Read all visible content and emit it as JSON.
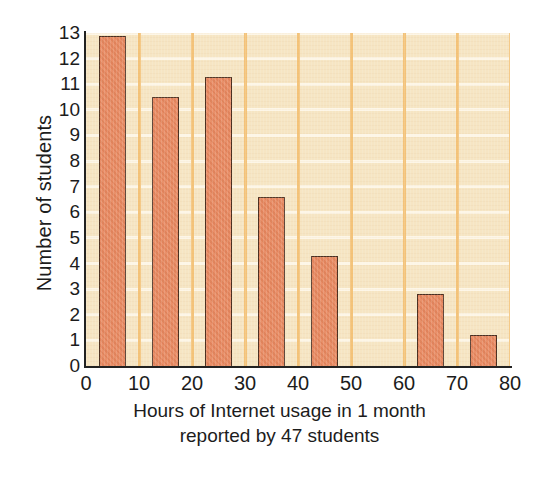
{
  "chart_data": {
    "type": "bar",
    "title": "",
    "subtitle": "",
    "xlabel": "Hours of Internet usage in 1 month",
    "xlabel_line2": "reported by 47 students",
    "ylabel": "Number of students",
    "xlim": [
      0,
      80
    ],
    "ylim": [
      0,
      13
    ],
    "xtick_labels": [
      "0",
      "10",
      "20",
      "30",
      "40",
      "50",
      "60",
      "70",
      "80"
    ],
    "xtick_values": [
      0,
      10,
      20,
      30,
      40,
      50,
      60,
      70,
      80
    ],
    "ytick_labels": [
      "0",
      "1",
      "2",
      "3",
      "4",
      "5",
      "6",
      "7",
      "8",
      "9",
      "10",
      "11",
      "12",
      "13"
    ],
    "ytick_values": [
      0,
      1,
      2,
      3,
      4,
      5,
      6,
      7,
      8,
      9,
      10,
      11,
      12,
      13
    ],
    "grid": "horizontal-and-vertical",
    "legend": "none",
    "bar_width": 5,
    "bars": [
      {
        "x_start": 2.5,
        "x_end": 7.5,
        "value": 12.9
      },
      {
        "x_start": 12.5,
        "x_end": 17.5,
        "value": 10.5
      },
      {
        "x_start": 22.5,
        "x_end": 27.5,
        "value": 11.3
      },
      {
        "x_start": 32.5,
        "x_end": 37.5,
        "value": 6.6
      },
      {
        "x_start": 42.5,
        "x_end": 47.5,
        "value": 4.3
      },
      {
        "x_start": 62.5,
        "x_end": 67.5,
        "value": 2.8
      },
      {
        "x_start": 72.5,
        "x_end": 77.5,
        "value": 1.2
      }
    ],
    "categories": [
      "5",
      "15",
      "25",
      "35",
      "45",
      "65",
      "75"
    ],
    "values": [
      12.9,
      10.5,
      11.3,
      6.6,
      4.3,
      2.8,
      1.2
    ],
    "colors": {
      "bar_fill": "#e8875e",
      "bar_edge": "#4a2f21",
      "panel_background": "#f6e5c3",
      "horizontal_gridline": "#fdf6e6",
      "vertical_gridline": "#f3c175",
      "axis": "#222222",
      "text": "#1c1c1c",
      "figure_background": "#ffffff"
    }
  }
}
